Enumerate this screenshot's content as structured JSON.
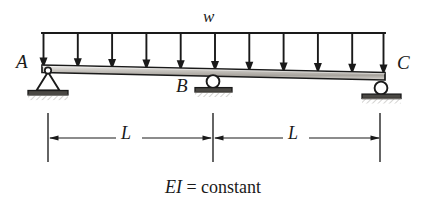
{
  "figure": {
    "type": "structural-beam-diagram",
    "background_color": "#ffffff",
    "ink_color": "#1a1a1a",
    "beam_fill_color": "#b8b5b0"
  },
  "load": {
    "label": "w",
    "kind": "uniformly-distributed-load",
    "arrow_count": 11,
    "direction": "down",
    "line_y": 33,
    "line_x_start": 42,
    "line_x_end": 385,
    "arrow_tip_y": 67
  },
  "beam": {
    "x_start": 42,
    "x_end": 385,
    "y_left_top": 66,
    "y_right_top": 73,
    "thickness": 7
  },
  "supports": [
    {
      "id": "A",
      "label": "A",
      "kind": "pin",
      "x": 48,
      "y": 70
    },
    {
      "id": "B",
      "label": "B",
      "kind": "roller",
      "x": 213,
      "y": 77
    },
    {
      "id": "C",
      "label": "C",
      "kind": "roller",
      "x": 381,
      "y": 84
    }
  ],
  "dimensions": {
    "line_y": 138,
    "extension_top_y": 113,
    "extension_bottom_y": 162,
    "ticks_x": [
      48,
      213,
      380
    ],
    "spans": [
      {
        "label": "L",
        "x_start": 48,
        "x_end": 213
      },
      {
        "label": "L",
        "x_start": 213,
        "x_end": 380
      }
    ]
  },
  "caption": {
    "symbol": "EI",
    "rest": " = constant",
    "full": "EI = constant"
  }
}
